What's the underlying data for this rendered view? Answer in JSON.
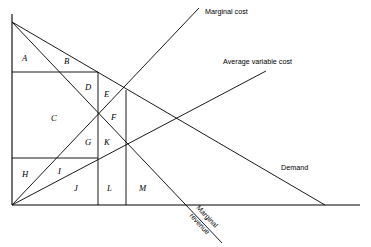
{
  "figure": {
    "background_color": "#ffffff",
    "line_color": "#000000",
    "width": 371,
    "height": 247
  },
  "axes": {
    "y_axis": {
      "name": "price-axis",
      "x": 12,
      "y_top": 14,
      "y_bottom": 205
    },
    "x_axis": {
      "name": "quantity-axis",
      "y": 205,
      "x_left": 12,
      "x_right": 360
    }
  },
  "curves": [
    {
      "id": "marginal-cost",
      "label": "Marginal cost",
      "label_x": 205,
      "label_y": 14,
      "x1": 12,
      "y1": 205,
      "x2": 199,
      "y2": 8
    },
    {
      "id": "average-variable-cost",
      "label": "Average variable cost",
      "label_x": 223,
      "label_y": 64,
      "x1": 12,
      "y1": 205,
      "x2": 266,
      "y2": 71
    },
    {
      "id": "demand",
      "label": "Demand",
      "label_x": 281,
      "label_y": 170,
      "x1": 12,
      "y1": 22,
      "x2": 325,
      "y2": 205
    },
    {
      "id": "marginal-revenue",
      "label_line1": "Marginal",
      "label_line2": "revenue",
      "label_x": 196,
      "label_y": 208,
      "label_rotation": 47,
      "x1": 12,
      "y1": 22,
      "x2": 222,
      "y2": 243
    }
  ],
  "construction_lines": [
    {
      "id": "horizontal-price-line-upper",
      "x1": 12,
      "y1": 72,
      "x2": 98,
      "y2": 72
    },
    {
      "id": "horizontal-price-line-lower",
      "x1": 12,
      "y1": 158,
      "x2": 98,
      "y2": 158
    },
    {
      "id": "vertical-quantity-line-inner",
      "x1": 98,
      "y1": 72,
      "x2": 98,
      "y2": 205
    },
    {
      "id": "vertical-quantity-line-outer",
      "x1": 126,
      "y1": 90,
      "x2": 126,
      "y2": 205
    }
  ],
  "region_labels": [
    {
      "id": "region-a",
      "text": "A",
      "x": 22,
      "y": 61
    },
    {
      "id": "region-b",
      "text": "B",
      "x": 64,
      "y": 64
    },
    {
      "id": "region-c",
      "text": "C",
      "x": 51,
      "y": 121
    },
    {
      "id": "region-d",
      "text": "D",
      "x": 85,
      "y": 90
    },
    {
      "id": "region-e",
      "text": "E",
      "x": 104,
      "y": 97
    },
    {
      "id": "region-f",
      "text": "F",
      "x": 111,
      "y": 120
    },
    {
      "id": "region-g",
      "text": "G",
      "x": 85,
      "y": 145
    },
    {
      "id": "region-h",
      "text": "H",
      "x": 22,
      "y": 177
    },
    {
      "id": "region-i",
      "text": "I",
      "x": 58,
      "y": 174
    },
    {
      "id": "region-j",
      "text": "J",
      "x": 74,
      "y": 191
    },
    {
      "id": "region-k",
      "text": "K",
      "x": 104,
      "y": 145
    },
    {
      "id": "region-l",
      "text": "L",
      "x": 107,
      "y": 191
    },
    {
      "id": "region-m",
      "text": "M",
      "x": 139,
      "y": 191
    }
  ]
}
